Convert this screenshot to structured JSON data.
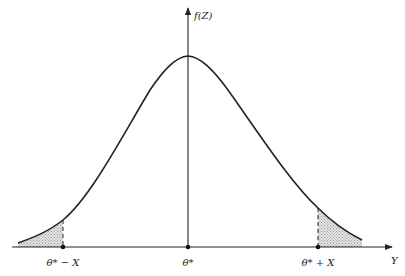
{
  "diagram": {
    "type": "normal-distribution-with-two-tails",
    "y_axis_label": "f(Z)",
    "x_axis_label": "Y",
    "tick_labels": {
      "left": "θ* − X",
      "center": "θ*",
      "right": "θ* + X"
    },
    "shaded_regions": [
      "left-tail",
      "right-tail"
    ],
    "colors": {
      "line": "#222222",
      "shade": "#cfcfcf"
    }
  }
}
